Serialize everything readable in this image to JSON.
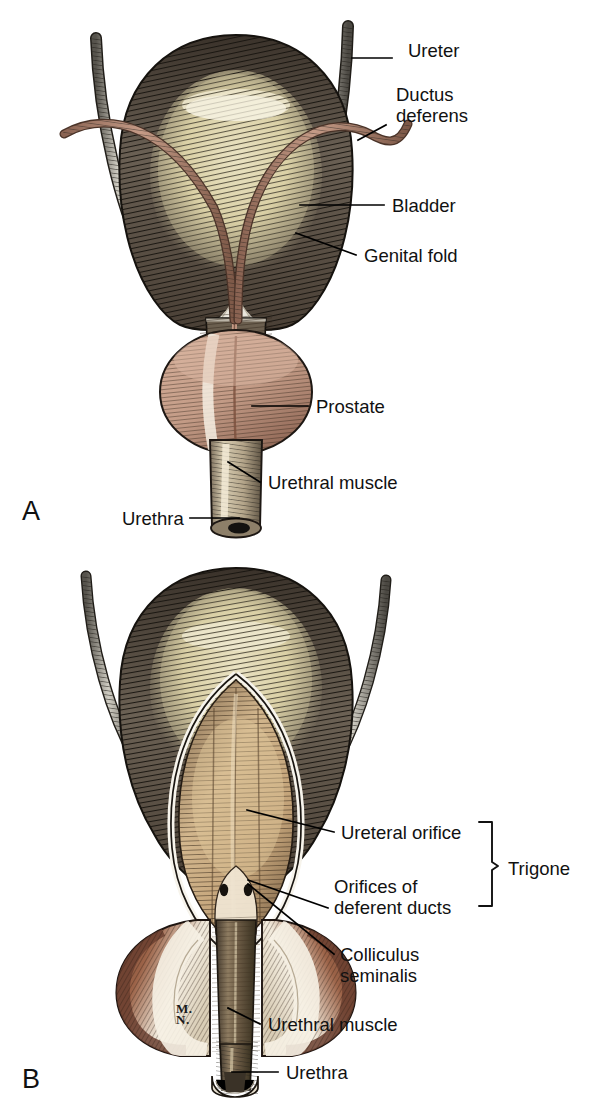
{
  "figure": {
    "background": "#ffffff",
    "ink": "#111111",
    "signature": "M.\nN."
  },
  "palette": {
    "bladder_dark": "#3b332b",
    "bladder_hatch": "#1d1a16",
    "bladder_highlight": "#e6e0c4",
    "bladder_cream": "#d8cfa8",
    "mucosa_tan": "#c9ac82",
    "mucosa_light": "#ded0b4",
    "prostate_pink": "#c9a391",
    "prostate_deep": "#8a5a46",
    "ductus_pink": "#b78a78",
    "ureter_gray": "#8e8d86",
    "white_rim": "#f7f4ec",
    "urethra_dark": "#4a4036",
    "lumen_black": "#141210"
  },
  "panel_a": {
    "letter": "A",
    "labels": [
      {
        "id": "ureter",
        "text": "Ureter",
        "x": 408,
        "y": 49,
        "leader": "M392,58 L352,58"
      },
      {
        "id": "ductus-deferens",
        "text": "Ductus\ndeferens",
        "x": 396,
        "y": 92,
        "leader": "M386,125 L358,140"
      },
      {
        "id": "bladder",
        "text": "Bladder",
        "x": 392,
        "y": 195,
        "leader": "M384,205 L300,205"
      },
      {
        "id": "genital-fold",
        "text": "Genital fold",
        "x": 364,
        "y": 244,
        "leader": "M356,255 L296,233"
      },
      {
        "id": "prostate",
        "text": "Prostate",
        "x": 316,
        "y": 396,
        "leader": "M308,406 L252,406"
      },
      {
        "id": "urethral-muscle",
        "text": "Urethral muscle",
        "x": 268,
        "y": 472,
        "leader": "M260,482 L228,462"
      },
      {
        "id": "urethra",
        "text": "Urethra",
        "x": 122,
        "y": 508,
        "leader": "M190,518 L239,518"
      }
    ]
  },
  "panel_b": {
    "letter": "B",
    "labels": [
      {
        "id": "ureteral-orifice",
        "text": "Ureteral orifice",
        "x": 341,
        "y": 822,
        "leader": "M334,832 L247,810"
      },
      {
        "id": "orifices-deferent",
        "text": "Orifices of\ndeferent ducts",
        "x": 334,
        "y": 876,
        "leader": "M328,908 L248,880"
      },
      {
        "id": "colliculus",
        "text": "Colliculus\nseminalis",
        "x": 340,
        "y": 944,
        "leader": "M334,954 L248,884"
      },
      {
        "id": "urethral-muscle-b",
        "text": "Urethral muscle",
        "x": 268,
        "y": 1014,
        "leader": "M260,1024 L228,1008"
      },
      {
        "id": "urethra-b",
        "text": "Urethra",
        "x": 286,
        "y": 1062,
        "leader": "M278,1072 L232,1072"
      }
    ],
    "bracket": {
      "label": "Trigone",
      "label_x": 508,
      "label_y": 858,
      "path": "M479,822 L492,822 L492,862 L498,866 L492,870 L492,906 L479,906"
    }
  }
}
